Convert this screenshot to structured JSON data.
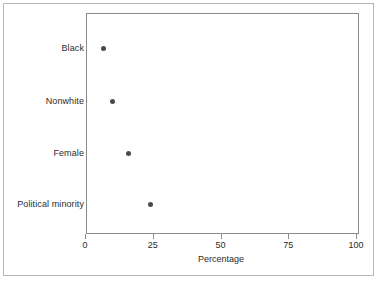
{
  "figure": {
    "background_color": "#ffffff",
    "frame_color": "#b6b6b6",
    "panel_border_color": "#8a8a8a",
    "point_color": "#4a4a4a"
  },
  "chart_data": {
    "type": "scatter",
    "title": "",
    "subtitle": "",
    "xlabel": "Percentage",
    "ylabel": "",
    "orientation": "horizontal",
    "categories": [
      "Black",
      "Nonwhite",
      "Female",
      "Political minority"
    ],
    "values": [
      7,
      10,
      16,
      24
    ],
    "points": [
      {
        "category": "Black",
        "value": 7
      },
      {
        "category": "Nonwhite",
        "value": 10
      },
      {
        "category": "Female",
        "value": 16
      },
      {
        "category": "Political minority",
        "value": 24
      }
    ],
    "xlim": [
      0,
      100
    ],
    "xticks": [
      0,
      25,
      50,
      75,
      100
    ],
    "xtick_labels": [
      "0",
      "25",
      "50",
      "75",
      "100"
    ],
    "grid": false,
    "legend": null,
    "legend_position": "none",
    "marker": "filled-circle",
    "marker_color": "#4a4a4a"
  }
}
